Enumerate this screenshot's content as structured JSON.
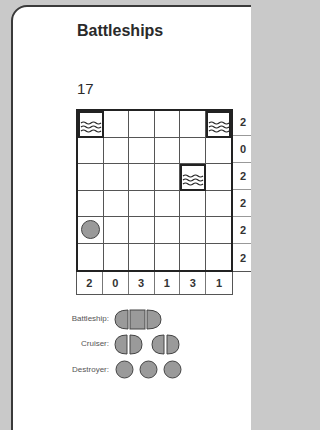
{
  "title": "Battleships",
  "puzzle_number": "17",
  "grid": {
    "rows": 6,
    "cols": 6,
    "cells": [
      [
        "water",
        "",
        "",
        "",
        "",
        "water"
      ],
      [
        "",
        "",
        "",
        "",
        "",
        ""
      ],
      [
        "",
        "",
        "",
        "",
        "water",
        ""
      ],
      [
        "",
        "",
        "",
        "",
        "",
        ""
      ],
      [
        "submarine",
        "",
        "",
        "",
        "",
        ""
      ],
      [
        "",
        "",
        "",
        "",
        "",
        ""
      ]
    ],
    "row_clues": [
      "2",
      "0",
      "2",
      "2",
      "2",
      "2"
    ],
    "col_clues": [
      "2",
      "0",
      "3",
      "1",
      "3",
      "1"
    ]
  },
  "legend": {
    "battleship_label": "Battleship:",
    "cruiser_label": "Cruiser:",
    "destroyer_label": "Destroyer:"
  },
  "colors": {
    "ship_fill": "#9a9a9a",
    "border": "#222222",
    "background": "#c9c9c9"
  }
}
